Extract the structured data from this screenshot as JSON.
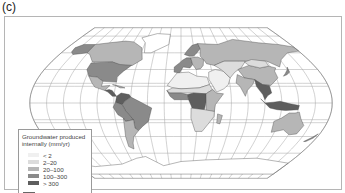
{
  "panel_label": "(c)",
  "map": {
    "title": "Groundwater produced internally (mm/yr)",
    "legend": {
      "title": "Groundwater produced internally (mm/yr)",
      "classes": [
        {
          "id": "c1",
          "label": "< 2",
          "color": "#f0f0f0"
        },
        {
          "id": "c2",
          "label": "2–20",
          "color": "#dcdcdc"
        },
        {
          "id": "c3",
          "label": "20–100",
          "color": "#b6b6b6"
        },
        {
          "id": "c4",
          "label": "100–300",
          "color": "#8a8a8a"
        },
        {
          "id": "c5",
          "label": "> 300",
          "color": "#5e5e5e"
        }
      ],
      "no_data": {
        "id": "nd",
        "label": "No data",
        "color": "#ffffff"
      }
    },
    "regions": [
      {
        "name": "alaska",
        "class": "c4"
      },
      {
        "name": "canada",
        "class": "c3"
      },
      {
        "name": "greenland",
        "class": "nd"
      },
      {
        "name": "usa",
        "class": "c4"
      },
      {
        "name": "mexico",
        "class": "c3"
      },
      {
        "name": "central-america",
        "class": "c5"
      },
      {
        "name": "caribbean",
        "class": "c3"
      },
      {
        "name": "colombia-venezuela",
        "class": "c5"
      },
      {
        "name": "brazil",
        "class": "c4"
      },
      {
        "name": "peru-bolivia",
        "class": "c4"
      },
      {
        "name": "argentina-chile",
        "class": "c3"
      },
      {
        "name": "scandinavia",
        "class": "c4"
      },
      {
        "name": "western-europe",
        "class": "c4"
      },
      {
        "name": "eastern-europe",
        "class": "c3"
      },
      {
        "name": "russia",
        "class": "c3"
      },
      {
        "name": "north-africa",
        "class": "c1"
      },
      {
        "name": "sahel",
        "class": "c2"
      },
      {
        "name": "west-africa",
        "class": "c4"
      },
      {
        "name": "central-africa",
        "class": "c5"
      },
      {
        "name": "east-africa",
        "class": "c3"
      },
      {
        "name": "southern-africa",
        "class": "c2"
      },
      {
        "name": "madagascar",
        "class": "c3"
      },
      {
        "name": "middle-east",
        "class": "c1"
      },
      {
        "name": "central-asia",
        "class": "c2"
      },
      {
        "name": "china",
        "class": "c3"
      },
      {
        "name": "mongolia",
        "class": "c2"
      },
      {
        "name": "india",
        "class": "c3"
      },
      {
        "name": "southeast-asia",
        "class": "c5"
      },
      {
        "name": "indonesia",
        "class": "c5"
      },
      {
        "name": "japan",
        "class": "c4"
      },
      {
        "name": "australia",
        "class": "c3"
      },
      {
        "name": "new-zealand",
        "class": "c4"
      },
      {
        "name": "antarctica",
        "class": "nd"
      }
    ]
  }
}
